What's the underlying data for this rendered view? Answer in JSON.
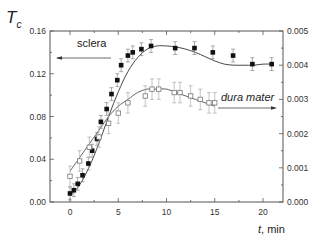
{
  "chart_data": {
    "type": "scatter",
    "title": "",
    "xlabel": "t, min",
    "ylabel": "T_c",
    "ylabel_main": "T",
    "ylabel_sub": "c",
    "xlim": [
      -2,
      22
    ],
    "ylim_left": [
      0.0,
      0.16
    ],
    "ylim_right": [
      0.0,
      0.005
    ],
    "x_ticks": [
      0,
      5,
      10,
      15,
      20
    ],
    "x_tick_labels": [
      "0",
      "5",
      "10",
      "15",
      "20"
    ],
    "y_left_ticks": [
      0.0,
      0.04,
      0.08,
      0.12,
      0.16
    ],
    "y_left_tick_labels": [
      "0.00",
      "0.04",
      "0.08",
      "0.12",
      "0.16"
    ],
    "y_right_ticks": [
      0.0,
      0.001,
      0.002,
      0.003,
      0.004,
      0.005
    ],
    "y_right_tick_labels": [
      "0.000",
      "0.001",
      "0.002",
      "0.003",
      "0.004",
      "0.005"
    ],
    "grid": false,
    "legend": "none (inline annotations with arrows)",
    "series": [
      {
        "name": "sclera",
        "axis": "left",
        "marker": "filled-square",
        "color": "#111111",
        "x": [
          0,
          0.4,
          0.8,
          1.3,
          1.9,
          2.3,
          2.8,
          3.2,
          3.8,
          4.3,
          4.9,
          5.3,
          6.0,
          6.5,
          7.4,
          8.4,
          10.9,
          12.9,
          14.8,
          16.9,
          18.9,
          20.9
        ],
        "y": [
          0.008,
          0.011,
          0.017,
          0.025,
          0.036,
          0.048,
          0.059,
          0.075,
          0.087,
          0.101,
          0.114,
          0.128,
          0.137,
          0.14,
          0.143,
          0.146,
          0.144,
          0.144,
          0.14,
          0.137,
          0.129,
          0.129
        ],
        "yerr": 0.006,
        "fit_x": [
          0,
          1,
          2,
          3,
          4,
          5,
          6,
          7,
          8,
          9,
          10,
          11,
          12,
          13,
          14,
          15,
          16,
          17,
          18,
          19,
          20,
          21
        ],
        "fit_y": [
          0.006,
          0.016,
          0.033,
          0.055,
          0.08,
          0.103,
          0.122,
          0.135,
          0.143,
          0.146,
          0.146,
          0.145,
          0.143,
          0.14,
          0.136,
          0.132,
          0.129,
          0.128,
          0.128,
          0.128,
          0.129,
          0.129
        ]
      },
      {
        "name": "dura mater",
        "axis": "right",
        "marker": "open-square",
        "color": "#777777",
        "x": [
          0,
          1,
          2,
          3,
          4,
          5,
          6,
          7.8,
          8.5,
          9.2,
          10.8,
          11.4,
          12.5,
          13.5,
          14.4,
          15
        ],
        "y": [
          0.00075,
          0.0012,
          0.0016,
          0.0019,
          0.0023,
          0.0026,
          0.0029,
          0.0031,
          0.0033,
          0.0033,
          0.0032,
          0.0032,
          0.0031,
          0.003,
          0.0029,
          0.0029
        ],
        "yerr": 0.0003,
        "fit_x": [
          0,
          1,
          2,
          3,
          4,
          5,
          6,
          7,
          8,
          9,
          10,
          11,
          12,
          13,
          14,
          15
        ],
        "fit_y": [
          0.0009,
          0.0013,
          0.0017,
          0.0021,
          0.0025,
          0.0028,
          0.003,
          0.0032,
          0.0033,
          0.0033,
          0.0033,
          0.0032,
          0.0031,
          0.003,
          0.0029,
          0.0028
        ]
      }
    ],
    "annotations": [
      {
        "text": "sclera",
        "arrow": "left",
        "points_to": "left axis"
      },
      {
        "text": "dura mater",
        "arrow": "right",
        "points_to": "right axis",
        "style": "italic"
      }
    ]
  },
  "labels": {
    "y_title_main": "T",
    "y_title_sub": "c",
    "x_title_italic": "t",
    "x_title_rest": ", min",
    "sclera_label": "sclera",
    "dura_label": "dura mater"
  }
}
